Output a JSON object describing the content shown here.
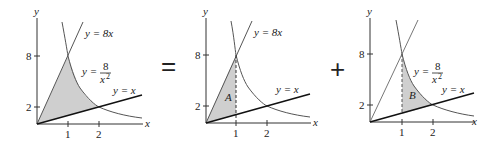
{
  "figure": {
    "operators": {
      "equals": "=",
      "plus": "+"
    },
    "colors": {
      "shade": "#cfcfcf",
      "curve": "#555555",
      "axis": "#333333",
      "bold_line": "#111111"
    },
    "panels": [
      {
        "id": "total",
        "axis_labels": {
          "x": "x",
          "y": "y"
        },
        "x_ticks": [
          "1",
          "2"
        ],
        "y_ticks": [
          "8",
          "2"
        ],
        "curves": {
          "line_8x": {
            "label": "y = 8x"
          },
          "hyperbola": {
            "label_lhs": "y =",
            "numerator": "8",
            "denominator": "x",
            "exponent": "2"
          },
          "line_x": {
            "label": "y = x"
          }
        }
      },
      {
        "id": "region-A",
        "axis_labels": {
          "x": "x",
          "y": "y"
        },
        "x_ticks": [
          "1",
          "2"
        ],
        "y_ticks": [
          "8",
          "2"
        ],
        "region_label": "A",
        "curves": {
          "line_8x": {
            "label": "y = 8x"
          },
          "line_x": {
            "label": "y = x"
          }
        }
      },
      {
        "id": "region-B",
        "axis_labels": {
          "x": "x",
          "y": "y"
        },
        "x_ticks": [
          "1",
          "2"
        ],
        "y_ticks": [
          "8",
          "2"
        ],
        "region_label": "B",
        "curves": {
          "hyperbola": {
            "label_lhs": "y =",
            "numerator": "8",
            "denominator": "x",
            "exponent": "2"
          },
          "line_x": {
            "label": "y = x"
          }
        }
      }
    ]
  }
}
